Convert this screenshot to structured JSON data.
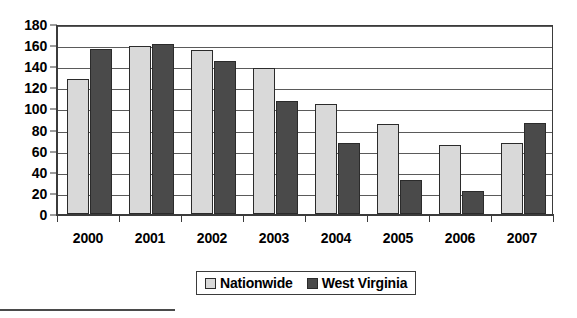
{
  "chart_data": {
    "type": "bar",
    "title": "",
    "subtitle": "",
    "xlabel": "",
    "ylabel": "",
    "categories": [
      "2000",
      "2001",
      "2002",
      "2003",
      "2004",
      "2005",
      "2006",
      "2007"
    ],
    "series": [
      {
        "name": "Nationwide",
        "color": "#d9d9d9",
        "values": [
          128,
          159,
          155,
          138,
          104,
          85,
          65,
          67
        ]
      },
      {
        "name": "West Virginia",
        "color": "#4a4a4a",
        "values": [
          156,
          161,
          145,
          107,
          67,
          32,
          22,
          86
        ]
      }
    ],
    "ylim": [
      0,
      180
    ],
    "ytick_step": 20,
    "yticks": [
      0,
      20,
      40,
      60,
      80,
      100,
      120,
      140,
      160,
      180
    ],
    "ytick_labels": [
      "0",
      "20",
      "40",
      "60",
      "80",
      "100",
      "120",
      "140",
      "160",
      "180"
    ],
    "grid": true,
    "grid_axis": "y",
    "legend_position": "bottom-center",
    "legend_entries": [
      "Nationwide",
      "West Virginia"
    ],
    "annotations": []
  },
  "colors": {
    "axis": "#3b3b3b",
    "gridline": "#5a5a5a",
    "plot_background": "#ffffff",
    "series_nationwide": "#d9d9d9",
    "series_west_virginia": "#4a4a4a"
  }
}
